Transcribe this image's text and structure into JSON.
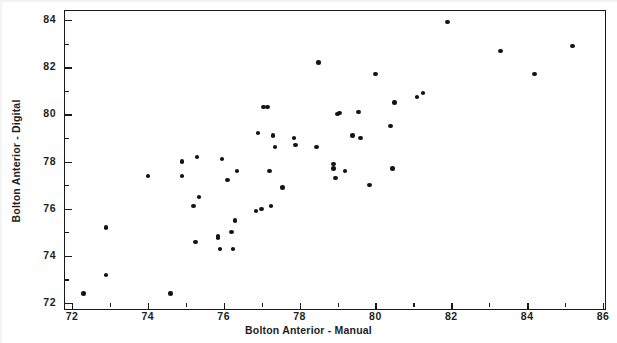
{
  "chart_data": {
    "type": "scatter",
    "title": "",
    "xlabel": "Bolton Anterior - Manual",
    "ylabel": "Bolton Anterior - Digital",
    "xlim": [
      71.6,
      86.2
    ],
    "ylim": [
      71.6,
      84.4
    ],
    "xticks": [
      72,
      74,
      76,
      78,
      80,
      82,
      84,
      86
    ],
    "xtick_labels": [
      "72",
      "74",
      "76",
      "78",
      "80",
      "82",
      "84",
      "86"
    ],
    "yticks": [
      72,
      74,
      76,
      78,
      80,
      82,
      84
    ],
    "ytick_labels": [
      "72",
      "74",
      "76",
      "78",
      "80",
      "82",
      "84"
    ],
    "minor_ticks": true,
    "grid": false,
    "legend": null,
    "marker": "filled-circle",
    "marker_color": "#141414",
    "n_points": 57,
    "points": [
      {
        "x": 72.3,
        "y": 72.4
      },
      {
        "x": 72.9,
        "y": 73.2
      },
      {
        "x": 72.9,
        "y": 75.2
      },
      {
        "x": 74.0,
        "y": 77.4
      },
      {
        "x": 74.6,
        "y": 72.4
      },
      {
        "x": 74.9,
        "y": 77.4
      },
      {
        "x": 74.9,
        "y": 78.0
      },
      {
        "x": 75.2,
        "y": 76.1
      },
      {
        "x": 75.25,
        "y": 74.6
      },
      {
        "x": 75.3,
        "y": 78.2
      },
      {
        "x": 75.35,
        "y": 76.5
      },
      {
        "x": 75.85,
        "y": 74.75
      },
      {
        "x": 75.85,
        "y": 74.85
      },
      {
        "x": 75.9,
        "y": 74.3
      },
      {
        "x": 75.95,
        "y": 78.1
      },
      {
        "x": 76.1,
        "y": 77.2
      },
      {
        "x": 76.2,
        "y": 75.0
      },
      {
        "x": 76.25,
        "y": 74.3
      },
      {
        "x": 76.3,
        "y": 75.5
      },
      {
        "x": 76.35,
        "y": 77.6
      },
      {
        "x": 76.85,
        "y": 75.9
      },
      {
        "x": 76.9,
        "y": 79.2
      },
      {
        "x": 77.0,
        "y": 76.0
      },
      {
        "x": 77.05,
        "y": 80.3
      },
      {
        "x": 77.15,
        "y": 80.3
      },
      {
        "x": 77.2,
        "y": 77.6
      },
      {
        "x": 77.25,
        "y": 76.1
      },
      {
        "x": 77.3,
        "y": 79.1
      },
      {
        "x": 77.35,
        "y": 78.6
      },
      {
        "x": 77.55,
        "y": 76.9
      },
      {
        "x": 77.85,
        "y": 79.0
      },
      {
        "x": 77.9,
        "y": 78.7
      },
      {
        "x": 78.45,
        "y": 78.6
      },
      {
        "x": 78.5,
        "y": 82.2
      },
      {
        "x": 78.9,
        "y": 77.9
      },
      {
        "x": 78.9,
        "y": 77.7
      },
      {
        "x": 78.95,
        "y": 77.3
      },
      {
        "x": 79.0,
        "y": 80.0
      },
      {
        "x": 79.05,
        "y": 80.05
      },
      {
        "x": 79.2,
        "y": 77.6
      },
      {
        "x": 79.4,
        "y": 79.1
      },
      {
        "x": 79.55,
        "y": 80.1
      },
      {
        "x": 79.6,
        "y": 79.0
      },
      {
        "x": 79.85,
        "y": 77.0
      },
      {
        "x": 80.0,
        "y": 81.7
      },
      {
        "x": 80.4,
        "y": 79.5
      },
      {
        "x": 80.45,
        "y": 77.7
      },
      {
        "x": 80.5,
        "y": 80.5
      },
      {
        "x": 81.1,
        "y": 80.75
      },
      {
        "x": 81.25,
        "y": 80.9
      },
      {
        "x": 81.9,
        "y": 83.9
      },
      {
        "x": 83.3,
        "y": 82.7
      },
      {
        "x": 84.2,
        "y": 81.7
      },
      {
        "x": 85.2,
        "y": 82.9
      }
    ]
  },
  "figure": {
    "background_color": "#ffffff",
    "frame_color": "#1a1a1a"
  }
}
